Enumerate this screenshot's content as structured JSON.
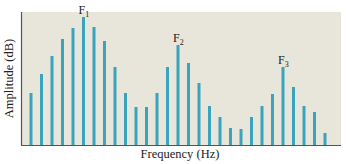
{
  "chart_data": {
    "type": "bar",
    "title": "",
    "xlabel": "Frequency (Hz)",
    "ylabel": "Amplitude (dB)",
    "grid": false,
    "legend": null,
    "ylim": [
      0,
      133
    ],
    "x_tick_labels": [],
    "y_tick_labels": [],
    "categories": [
      1,
      2,
      3,
      4,
      5,
      6,
      7,
      8,
      9,
      10,
      11,
      12,
      13,
      14,
      15,
      16,
      17,
      18,
      19,
      20,
      21,
      22,
      23,
      24,
      25,
      26,
      27,
      28,
      29
    ],
    "values": [
      52,
      71,
      89,
      106,
      117,
      128,
      118,
      104,
      78,
      52,
      38,
      38,
      52,
      78,
      100,
      82,
      62,
      39,
      28,
      17,
      16,
      28,
      39,
      51,
      78,
      58,
      39,
      33,
      12
    ],
    "annotations": [
      {
        "text": "F",
        "sub": "1",
        "bar_index": 5
      },
      {
        "text": "F",
        "sub": "2",
        "bar_index": 14
      },
      {
        "text": "F",
        "sub": "3",
        "bar_index": 24
      }
    ],
    "colors": {
      "bar": "#3aa3bd",
      "background": "#e8e5da",
      "axis": "#555555"
    }
  }
}
